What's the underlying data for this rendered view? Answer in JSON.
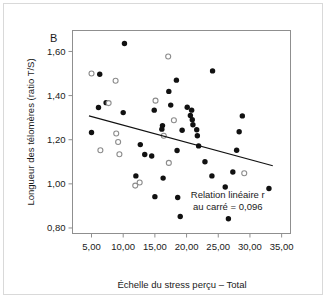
{
  "panel": {
    "letter": "B"
  },
  "chart_data": {
    "type": "scatter",
    "title": "B",
    "xlabel": "Échelle du stress perçu – Total",
    "ylabel": "Longueur des télomères (ratio T/S)",
    "xlim": [
      2.0,
      36.4
    ],
    "ylim": [
      0.775,
      1.695
    ],
    "xticks": [
      5,
      10,
      15,
      20,
      25,
      30,
      35
    ],
    "xticklabels": [
      "5,00",
      "10,00",
      "15,00",
      "20,00",
      "25,00",
      "30,00",
      "35,00"
    ],
    "yticks": [
      0.8,
      1.0,
      1.2,
      1.4,
      1.6
    ],
    "yticklabels": [
      "0,80",
      "1,00",
      "1,20",
      "1,40",
      "1,60"
    ],
    "grid": false,
    "legend": "none",
    "annotation": {
      "lines": [
        "Relation linéaire r",
        "au carré = 0,096"
      ],
      "r_squared": 0.096,
      "x": 26.5,
      "y": 0.935
    },
    "trendline": {
      "name": "Relation linéaire",
      "x": [
        4.6,
        33.6
      ],
      "y": [
        1.308,
        1.082
      ]
    },
    "series": [
      {
        "name": "Points pleins",
        "marker": "filled-circle",
        "color": "#111111",
        "points": [
          [
            10.2,
            1.636
          ],
          [
            6.3,
            1.497
          ],
          [
            7.3,
            1.368
          ],
          [
            6.1,
            1.346
          ],
          [
            10.0,
            1.323
          ],
          [
            5.0,
            1.233
          ],
          [
            12.0,
            1.036
          ],
          [
            12.7,
            1.178
          ],
          [
            13.4,
            1.133
          ],
          [
            14.5,
            1.126
          ],
          [
            14.9,
            1.334
          ],
          [
            15.0,
            0.942
          ],
          [
            16.2,
            1.264
          ],
          [
            16.1,
            1.248
          ],
          [
            16.3,
            1.026
          ],
          [
            17.2,
            1.419
          ],
          [
            17.5,
            1.357
          ],
          [
            18.4,
            1.47
          ],
          [
            18.5,
            1.151
          ],
          [
            18.6,
            0.938
          ],
          [
            19.0,
            0.852
          ],
          [
            19.3,
            1.243
          ],
          [
            20.1,
            1.347
          ],
          [
            20.6,
            1.31
          ],
          [
            20.8,
            1.334
          ],
          [
            20.9,
            1.291
          ],
          [
            21.0,
            1.268
          ],
          [
            21.6,
            1.245
          ],
          [
            21.7,
            1.218
          ],
          [
            21.9,
            1.172
          ],
          [
            22.9,
            1.1
          ],
          [
            24.1,
            1.512
          ],
          [
            24.0,
            1.036
          ],
          [
            26.1,
            0.986
          ],
          [
            26.6,
            0.842
          ],
          [
            27.3,
            1.054
          ],
          [
            27.9,
            1.152
          ],
          [
            28.3,
            1.236
          ],
          [
            28.8,
            1.308
          ],
          [
            33.0,
            0.979
          ]
        ]
      },
      {
        "name": "Points ouverts",
        "marker": "open-circle",
        "color": "#ffffff",
        "points": [
          [
            5.0,
            1.5
          ],
          [
            6.4,
            1.152
          ],
          [
            7.7,
            1.366
          ],
          [
            8.8,
            1.467
          ],
          [
            8.9,
            1.228
          ],
          [
            9.2,
            1.19
          ],
          [
            9.4,
            1.134
          ],
          [
            11.9,
            0.992
          ],
          [
            12.6,
            1.006
          ],
          [
            15.1,
            1.377
          ],
          [
            16.4,
            1.218
          ],
          [
            17.1,
            1.577
          ],
          [
            17.2,
            1.095
          ],
          [
            18.0,
            1.288
          ],
          [
            29.1,
            1.048
          ]
        ]
      }
    ]
  }
}
